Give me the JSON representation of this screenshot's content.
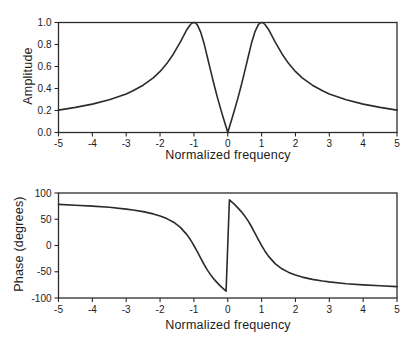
{
  "figure": {
    "background": "#ffffff",
    "line_color": "#2b2b2b",
    "text_color": "#1c1c1c"
  },
  "chart_data": [
    {
      "type": "line",
      "title": "",
      "xlabel": "Normalized frequency",
      "ylabel": "Amplitude",
      "xlim": [
        -5,
        5
      ],
      "ylim": [
        0,
        1
      ],
      "grid": false,
      "legend": "none",
      "xticks": [
        -5,
        -4,
        -3,
        -2,
        -1,
        0,
        1,
        2,
        3,
        4,
        5
      ],
      "xtick_labels": [
        "-5",
        "-4",
        "-3",
        "-2",
        "-1",
        "0",
        "1",
        "2",
        "3",
        "4",
        "5"
      ],
      "yticks": [
        0,
        0.2,
        0.4,
        0.6,
        0.8,
        1.0
      ],
      "ytick_labels": [
        "0.0",
        "0.2",
        "0.4",
        "0.6",
        "0.8",
        "1.0"
      ],
      "series": [
        {
          "name": "amplitude-response-curve",
          "x": [
            -5,
            -4.5,
            -4,
            -3.5,
            -3,
            -2.8,
            -2.5,
            -2.2,
            -2,
            -1.8,
            -1.6,
            -1.4,
            -1.2,
            -1.1,
            -1.05,
            -1,
            -0.95,
            -0.9,
            -0.8,
            -0.7,
            -0.6,
            -0.5,
            -0.4,
            -0.3,
            -0.2,
            -0.1,
            -0.05,
            0,
            0.05,
            0.1,
            0.2,
            0.3,
            0.4,
            0.5,
            0.6,
            0.7,
            0.8,
            0.9,
            0.95,
            1,
            1.05,
            1.1,
            1.2,
            1.4,
            1.6,
            1.8,
            2,
            2.2,
            2.5,
            2.8,
            3,
            3.5,
            4,
            4.5,
            5
          ],
          "y": [
            0.204,
            0.228,
            0.258,
            0.297,
            0.351,
            0.379,
            0.43,
            0.497,
            0.555,
            0.626,
            0.716,
            0.825,
            0.939,
            0.982,
            0.995,
            1,
            0.995,
            0.978,
            0.912,
            0.808,
            0.684,
            0.555,
            0.43,
            0.313,
            0.204,
            0.1,
            0.05,
            0,
            0.05,
            0.1,
            0.204,
            0.313,
            0.43,
            0.555,
            0.684,
            0.808,
            0.912,
            0.978,
            0.995,
            1,
            0.995,
            0.982,
            0.939,
            0.825,
            0.716,
            0.626,
            0.555,
            0.497,
            0.43,
            0.379,
            0.351,
            0.297,
            0.258,
            0.228,
            0.204
          ]
        }
      ]
    },
    {
      "type": "line",
      "title": "",
      "xlabel": "Normalized frequency",
      "ylabel": "Phase (degrees)",
      "xlim": [
        -5,
        5
      ],
      "ylim": [
        -100,
        100
      ],
      "grid": false,
      "legend": "none",
      "xticks": [
        -5,
        -4,
        -3,
        -2,
        -1,
        0,
        1,
        2,
        3,
        4,
        5
      ],
      "xtick_labels": [
        "-5",
        "-4",
        "-3",
        "-2",
        "-1",
        "0",
        "1",
        "2",
        "3",
        "4",
        "5"
      ],
      "yticks": [
        -100,
        -50,
        0,
        50,
        100
      ],
      "ytick_labels": [
        "-100",
        "-50",
        "0",
        "50",
        "100"
      ],
      "series": [
        {
          "name": "phase-response-curve",
          "x": [
            -5,
            -4.5,
            -4,
            -3.5,
            -3,
            -2.8,
            -2.5,
            -2.2,
            -2,
            -1.8,
            -1.6,
            -1.4,
            -1.2,
            -1.1,
            -1.05,
            -1,
            -0.95,
            -0.9,
            -0.8,
            -0.7,
            -0.6,
            -0.5,
            -0.4,
            -0.3,
            -0.2,
            -0.1,
            -0.05,
            0.05,
            0.1,
            0.2,
            0.3,
            0.4,
            0.5,
            0.6,
            0.7,
            0.8,
            0.9,
            0.95,
            1,
            1.05,
            1.1,
            1.2,
            1.4,
            1.6,
            1.8,
            2,
            2.2,
            2.5,
            2.8,
            3,
            3.5,
            4,
            4.5,
            5
          ],
          "y": [
            78.2,
            76.8,
            75.1,
            72.7,
            69.4,
            67.7,
            64.5,
            60.2,
            56.3,
            51.2,
            44.3,
            34.4,
            20.1,
            10.8,
            5.6,
            0,
            -5.9,
            -11.9,
            -24.2,
            -36.1,
            -46.9,
            -56.3,
            -64.5,
            -71.7,
            -78.2,
            -84.2,
            -87.1,
            87.1,
            84.2,
            78.2,
            71.7,
            64.5,
            56.3,
            46.9,
            36.1,
            24.2,
            11.9,
            5.9,
            0,
            -5.6,
            -10.8,
            -20.1,
            -34.4,
            -44.3,
            -51.2,
            -56.3,
            -60.2,
            -64.5,
            -67.7,
            -69.4,
            -72.7,
            -75.1,
            -76.8,
            -78.2
          ]
        }
      ]
    }
  ]
}
